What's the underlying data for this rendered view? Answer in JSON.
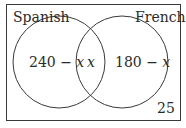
{
  "diagram": {
    "type": "venn",
    "sets": [
      {
        "name": "Spanish",
        "only_label": "240 − x",
        "only_value_expr": "240 - x"
      },
      {
        "name": "French",
        "only_label": "180 − x",
        "only_value_expr": "180 - x"
      }
    ],
    "intersection_label": "x",
    "outside_label": "25",
    "colors": {
      "stroke": "#3a3a3a",
      "text": "#2a2a2a",
      "background": "#ffffff"
    }
  }
}
